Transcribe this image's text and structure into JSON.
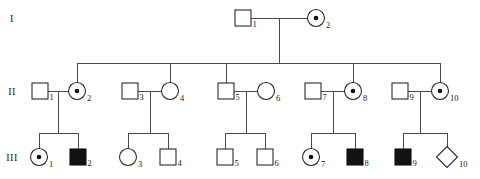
{
  "chart_data": {
    "type": "diagram",
    "generation_labels": [
      "I",
      "II",
      "III"
    ],
    "symbol_legend": {
      "square": "male",
      "circle": "female",
      "diamond": "sex unspecified",
      "filled": "affected",
      "dot": "carrier"
    },
    "individuals": [
      {
        "gen": "I",
        "id": "1",
        "label": "1",
        "sex": "male",
        "shape": "square",
        "status": "unaffected",
        "cx": 243,
        "cy": 18
      },
      {
        "gen": "I",
        "id": "2",
        "label": "2",
        "sex": "female",
        "shape": "circle",
        "status": "carrier",
        "cx": 316,
        "cy": 18
      },
      {
        "gen": "II",
        "id": "1",
        "label": "1",
        "sex": "male",
        "shape": "square",
        "status": "unaffected",
        "cx": 40,
        "cy": 91
      },
      {
        "gen": "II",
        "id": "2",
        "label": "2",
        "sex": "female",
        "shape": "circle",
        "status": "carrier",
        "cx": 77,
        "cy": 91
      },
      {
        "gen": "II",
        "id": "3",
        "label": "3",
        "sex": "male",
        "shape": "square",
        "status": "unaffected",
        "cx": 130,
        "cy": 91
      },
      {
        "gen": "II",
        "id": "4",
        "label": "4",
        "sex": "female",
        "shape": "circle",
        "status": "unaffected",
        "cx": 170,
        "cy": 91
      },
      {
        "gen": "II",
        "id": "5",
        "label": "5",
        "sex": "male",
        "shape": "square",
        "status": "unaffected",
        "cx": 226,
        "cy": 91
      },
      {
        "gen": "II",
        "id": "6",
        "label": "6",
        "sex": "female",
        "shape": "circle",
        "status": "unaffected",
        "cx": 266,
        "cy": 91
      },
      {
        "gen": "II",
        "id": "7",
        "label": "7",
        "sex": "male",
        "shape": "square",
        "status": "unaffected",
        "cx": 313,
        "cy": 91
      },
      {
        "gen": "II",
        "id": "8",
        "label": "8",
        "sex": "female",
        "shape": "circle",
        "status": "carrier",
        "cx": 353,
        "cy": 91
      },
      {
        "gen": "II",
        "id": "9",
        "label": "9",
        "sex": "male",
        "shape": "square",
        "status": "unaffected",
        "cx": 400,
        "cy": 91
      },
      {
        "gen": "II",
        "id": "10",
        "label": "10",
        "sex": "female",
        "shape": "circle",
        "status": "carrier",
        "cx": 440,
        "cy": 91
      },
      {
        "gen": "III",
        "id": "1",
        "label": "1",
        "sex": "female",
        "shape": "circle",
        "status": "carrier",
        "cx": 39,
        "cy": 157
      },
      {
        "gen": "III",
        "id": "2",
        "label": "2",
        "sex": "male",
        "shape": "square",
        "status": "affected",
        "cx": 78,
        "cy": 157
      },
      {
        "gen": "III",
        "id": "3",
        "label": "3",
        "sex": "female",
        "shape": "circle",
        "status": "unaffected",
        "cx": 128,
        "cy": 157
      },
      {
        "gen": "III",
        "id": "4",
        "label": "4",
        "sex": "male",
        "shape": "square",
        "status": "unaffected",
        "cx": 168,
        "cy": 157
      },
      {
        "gen": "III",
        "id": "5",
        "label": "5",
        "sex": "male",
        "shape": "square",
        "status": "unaffected",
        "cx": 225,
        "cy": 157
      },
      {
        "gen": "III",
        "id": "6",
        "label": "6",
        "sex": "male",
        "shape": "square",
        "status": "unaffected",
        "cx": 265,
        "cy": 157
      },
      {
        "gen": "III",
        "id": "7",
        "label": "7",
        "sex": "female",
        "shape": "circle",
        "status": "carrier",
        "cx": 311,
        "cy": 157
      },
      {
        "gen": "III",
        "id": "8",
        "label": "8",
        "sex": "male",
        "shape": "square",
        "status": "affected",
        "cx": 355,
        "cy": 157
      },
      {
        "gen": "III",
        "id": "9",
        "label": "9",
        "sex": "male",
        "shape": "square",
        "status": "affected",
        "cx": 403,
        "cy": 157
      },
      {
        "gen": "III",
        "id": "10",
        "label": "10",
        "sex": "unknown",
        "shape": "diamond",
        "status": "unaffected",
        "cx": 447,
        "cy": 157
      }
    ],
    "matings": [
      {
        "partner_a": "I-1",
        "partner_b": "I-2",
        "children": [
          "II-2",
          "II-4",
          "II-5",
          "II-8",
          "II-10"
        ]
      },
      {
        "partner_a": "II-1",
        "partner_b": "II-2",
        "children": [
          "III-1",
          "III-2"
        ]
      },
      {
        "partner_a": "II-3",
        "partner_b": "II-4",
        "children": [
          "III-3",
          "III-4"
        ]
      },
      {
        "partner_a": "II-5",
        "partner_b": "II-6",
        "children": [
          "III-5",
          "III-6"
        ]
      },
      {
        "partner_a": "II-7",
        "partner_b": "II-8",
        "children": [
          "III-7",
          "III-8"
        ]
      },
      {
        "partner_a": "II-9",
        "partner_b": "II-10",
        "children": [
          "III-9",
          "III-10"
        ]
      }
    ],
    "colors": {
      "line": "#4a4a4a",
      "symbol_outline": "#2a2a2a",
      "symbol_fill_affected": "#111111",
      "background": "#ffffff",
      "text": "#1a1a1a"
    },
    "geometry": {
      "gen_label_x": 12,
      "gen1_y": 18,
      "gen2_y": 91,
      "gen3_y": 157,
      "square_size": 16,
      "circle_radius": 8.5,
      "diamond_half": 10.5,
      "carrier_dot_radius": 2.3,
      "gen1_sib_bar_y": 63,
      "gen1_couple_mid_x": 280,
      "gen2_sib_bar_offset": 24
    }
  }
}
